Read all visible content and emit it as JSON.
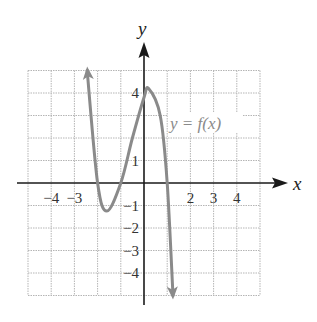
{
  "chart_data": {
    "type": "line",
    "title": "",
    "xlabel": "x",
    "ylabel": "y",
    "xlim": [
      -5,
      5
    ],
    "ylim": [
      -5,
      5
    ],
    "grid": true,
    "x_tick_labels": [
      "-4",
      "-3",
      "2",
      "3",
      "4"
    ],
    "y_tick_labels": [
      "4",
      "1",
      "-1",
      "-2",
      "-3",
      "-4"
    ],
    "series": [
      {
        "name": "y = f(x)",
        "color": "#8a8a8a",
        "arrows_at_ends": true,
        "points": [
          {
            "x": -2.45,
            "y": 5
          },
          {
            "x": -2.0,
            "y": 0
          },
          {
            "x": -1.6,
            "y": -1.25
          },
          {
            "x": -1.0,
            "y": 0
          },
          {
            "x": -0.5,
            "y": 2
          },
          {
            "x": 0.0,
            "y": 3.8
          },
          {
            "x": 0.2,
            "y": 4.2
          },
          {
            "x": 0.7,
            "y": 3
          },
          {
            "x": 1.0,
            "y": 0
          },
          {
            "x": 1.25,
            "y": -5
          }
        ]
      }
    ],
    "annotations": [
      {
        "text": "y = f(x)",
        "x": 1.2,
        "y": 2.8
      }
    ],
    "colors": {
      "axis": "#1a1a1a",
      "grid": "#b5b5b5",
      "curve": "#8a8a8a"
    }
  },
  "labels": {
    "x_axis": "x",
    "y_axis": "y",
    "function": "y = f(x)",
    "x_ticks": [
      {
        "text": "−4",
        "x": -4
      },
      {
        "text": "−3",
        "x": -3
      },
      {
        "text": "2",
        "x": 2
      },
      {
        "text": "3",
        "x": 3
      },
      {
        "text": "4",
        "x": 4
      }
    ],
    "y_ticks": [
      {
        "text": "4",
        "y": 4
      },
      {
        "text": "1",
        "y": 1
      },
      {
        "text": "−1",
        "y": -1
      },
      {
        "text": "−2",
        "y": -2
      },
      {
        "text": "−3",
        "y": -3
      },
      {
        "text": "−4",
        "y": -4
      }
    ]
  }
}
